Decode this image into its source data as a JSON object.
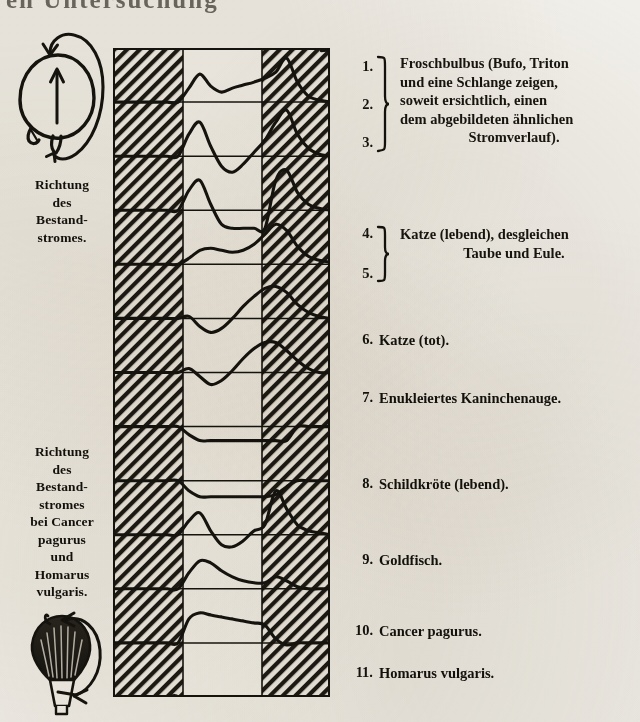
{
  "header": {
    "running_head": "en Untersuchung"
  },
  "left_captions": [
    {
      "id": "direction-standing-current",
      "lines": [
        "Richtung",
        "des",
        "Bestand-",
        "stromes."
      ]
    },
    {
      "id": "direction-standing-current-crustacea",
      "lines": [
        "Richtung",
        "des",
        "Bestand-",
        "stromes",
        "bei Cancer",
        "pagurus",
        "und",
        "Homarus",
        "vulgaris."
      ]
    }
  ],
  "diagrams": [
    {
      "id": "vertebrate-eye-current-diagram",
      "icon": "eyeball-with-current-loop"
    },
    {
      "id": "crustacean-eye-current-diagram",
      "icon": "compound-eye-with-current-loop"
    }
  ],
  "labels": [
    {
      "kind": "group",
      "numbers": [
        "1.",
        "2.",
        "3."
      ],
      "text_lines": [
        "Froschbulbus (Bufo, Triton",
        "und eine Schlange zeigen,",
        "soweit ersichtlich, einen",
        "dem abgebildeten ähnlichen",
        "Stromverlauf)."
      ]
    },
    {
      "kind": "group",
      "numbers": [
        "4.",
        "5."
      ],
      "text_lines": [
        "Katze (lebend), desgleichen",
        "Taube und Eule."
      ]
    },
    {
      "kind": "single",
      "number": "6.",
      "text": "Katze (tot)."
    },
    {
      "kind": "single",
      "number": "7.",
      "text": "Enukleiertes Kaninchenauge."
    },
    {
      "kind": "single",
      "number": "8.",
      "text": "Schildkröte (lebend)."
    },
    {
      "kind": "single",
      "number": "9.",
      "text": "Goldfisch."
    },
    {
      "kind": "single",
      "number": "10.",
      "text": "Cancer pagurus."
    },
    {
      "kind": "single",
      "number": "11.",
      "text": "Homarus vulgaris."
    }
  ],
  "chart_data": {
    "type": "line",
    "xlabel": "",
    "ylabel": "",
    "grid": true,
    "legend_position": "right",
    "columns": [
      {
        "name": "Dunkel (vor Belichtung)",
        "shaded": true,
        "x_start": 0,
        "x_end": 70
      },
      {
        "name": "Belichtung",
        "shaded": false,
        "x_start": 70,
        "x_end": 149
      },
      {
        "name": "Dunkel (nach Belichtung)",
        "shaded": true,
        "x_start": 149,
        "x_end": 217
      }
    ],
    "row_count": 11,
    "row_height": 59,
    "arrow": "time-axis-arrow-right",
    "series": [
      {
        "name": "Froschbulbus 1",
        "row": 1,
        "label_ref": "1.",
        "values": [
          0,
          0,
          0,
          0,
          0,
          0,
          0,
          14,
          28,
          16,
          10,
          14,
          17,
          20,
          24,
          30,
          44,
          20,
          6,
          2,
          0
        ]
      },
      {
        "name": "Froschbulbus 2",
        "row": 2,
        "label_ref": "2.",
        "values": [
          0,
          0,
          0,
          0,
          0,
          0,
          0,
          22,
          34,
          10,
          -10,
          -16,
          -8,
          4,
          16,
          34,
          46,
          22,
          8,
          2,
          0
        ]
      },
      {
        "name": "Froschbulbus 3",
        "row": 3,
        "label_ref": "3.",
        "values": [
          0,
          0,
          0,
          0,
          0,
          0,
          0,
          20,
          30,
          6,
          -14,
          -18,
          -18,
          -18,
          -18,
          30,
          40,
          18,
          6,
          2,
          0
        ]
      },
      {
        "name": "Katze lebend 4",
        "row": 4,
        "label_ref": "4.",
        "values": [
          0,
          0,
          0,
          0,
          0,
          0,
          0,
          6,
          14,
          16,
          14,
          12,
          14,
          20,
          30,
          40,
          34,
          18,
          8,
          4,
          2
        ]
      },
      {
        "name": "Katze lebend 5",
        "row": 5,
        "label_ref": "5.",
        "values": [
          0,
          0,
          0,
          0,
          0,
          0,
          0,
          2,
          -8,
          -14,
          -10,
          0,
          12,
          22,
          30,
          32,
          26,
          14,
          6,
          2,
          0
        ]
      },
      {
        "name": "Katze lebend 5b",
        "row": 6,
        "label_ref": "5.",
        "values": [
          0,
          0,
          0,
          0,
          0,
          0,
          0,
          4,
          -4,
          -12,
          -8,
          2,
          14,
          24,
          30,
          30,
          22,
          12,
          4,
          0,
          0
        ]
      },
      {
        "name": "Katze tot",
        "row": 7,
        "label_ref": "6.",
        "values": [
          0,
          0,
          0,
          0,
          0,
          0,
          0,
          -8,
          -14,
          -14,
          -14,
          -14,
          -14,
          -14,
          -14,
          -14,
          -14,
          0,
          0,
          0,
          0
        ]
      },
      {
        "name": "Kaninchenauge",
        "row": 8,
        "label_ref": "7.",
        "values": [
          0,
          0,
          0,
          0,
          0,
          0,
          0,
          -10,
          -16,
          -16,
          -16,
          -16,
          -16,
          -16,
          -16,
          -14,
          -6,
          0,
          0,
          0,
          0
        ]
      },
      {
        "name": "Schildkröte",
        "row": 9,
        "label_ref": "8.",
        "values": [
          0,
          0,
          0,
          0,
          0,
          0,
          0,
          14,
          22,
          4,
          -10,
          -12,
          -6,
          4,
          10,
          44,
          26,
          10,
          4,
          2,
          0
        ]
      },
      {
        "name": "Goldfisch",
        "row": 10,
        "label_ref": "9.",
        "values": [
          0,
          0,
          0,
          0,
          0,
          0,
          0,
          16,
          28,
          26,
          18,
          12,
          8,
          6,
          6,
          12,
          8,
          2,
          0,
          0,
          0
        ]
      },
      {
        "name": "Cancer pagurus",
        "row": 11,
        "label_ref": "10.",
        "values": [
          0,
          0,
          0,
          0,
          0,
          0,
          0,
          24,
          30,
          28,
          26,
          24,
          22,
          20,
          18,
          4,
          -2,
          0,
          0,
          0,
          0
        ]
      },
      {
        "name": "Homarus vulgaris",
        "row": 12,
        "label_ref": "11.",
        "values": [
          0,
          0,
          0,
          0,
          0,
          0,
          0,
          -22,
          -30,
          -30,
          -30,
          -30,
          -30,
          -30,
          -28,
          -8,
          0,
          0,
          0,
          0,
          0
        ]
      }
    ]
  }
}
